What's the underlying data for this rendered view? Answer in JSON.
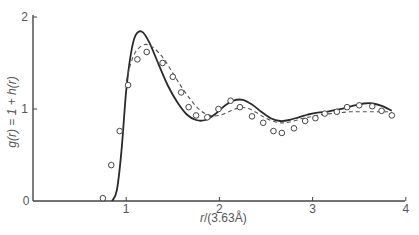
{
  "chart_data": {
    "type": "line",
    "title": "",
    "xlabel": "r/(3.63Å)",
    "ylabel": "g(r) = 1 + h(r)",
    "xlim": [
      0,
      4
    ],
    "ylim": [
      0,
      2
    ],
    "x_ticks": [
      "0",
      "1",
      "2",
      "3",
      "4"
    ],
    "y_ticks": [
      "0",
      "1",
      "2"
    ],
    "grid": false,
    "legend": null,
    "series": [
      {
        "name": "theory (solid)",
        "style": "solid",
        "x": [
          0.85,
          0.9,
          0.95,
          1.0,
          1.05,
          1.1,
          1.17,
          1.25,
          1.35,
          1.45,
          1.55,
          1.65,
          1.75,
          1.85,
          1.95,
          2.05,
          2.15,
          2.25,
          2.35,
          2.45,
          2.55,
          2.65,
          2.75,
          2.85,
          2.95,
          3.05,
          3.15,
          3.25,
          3.35,
          3.45,
          3.55,
          3.65,
          3.75,
          3.85
        ],
        "y": [
          0.0,
          0.12,
          0.55,
          1.2,
          1.6,
          1.8,
          1.84,
          1.72,
          1.48,
          1.25,
          1.07,
          0.94,
          0.88,
          0.88,
          0.94,
          1.03,
          1.09,
          1.1,
          1.05,
          0.97,
          0.9,
          0.87,
          0.88,
          0.91,
          0.94,
          0.96,
          0.97,
          0.99,
          1.01,
          1.04,
          1.06,
          1.06,
          1.03,
          0.98
        ]
      },
      {
        "name": "theory (dashed)",
        "style": "dashed",
        "x": [
          1.0,
          1.05,
          1.1,
          1.17,
          1.23,
          1.3,
          1.4,
          1.5,
          1.6,
          1.7,
          1.8,
          1.9,
          2.0,
          2.1,
          2.2,
          2.3,
          2.4,
          2.5,
          2.6,
          2.7,
          2.8,
          2.9,
          3.0,
          3.1,
          3.2,
          3.3,
          3.4,
          3.5,
          3.6,
          3.7,
          3.8,
          3.85
        ],
        "y": [
          1.3,
          1.5,
          1.62,
          1.69,
          1.7,
          1.66,
          1.55,
          1.39,
          1.23,
          1.09,
          0.98,
          0.93,
          0.93,
          0.97,
          1.01,
          1.01,
          0.96,
          0.9,
          0.86,
          0.85,
          0.87,
          0.9,
          0.92,
          0.94,
          0.95,
          0.96,
          0.97,
          0.97,
          0.97,
          0.97,
          0.97,
          0.96
        ]
      },
      {
        "name": "experiment (circles)",
        "style": "markers",
        "x": [
          0.75,
          0.84,
          0.93,
          1.02,
          1.12,
          1.22,
          1.39,
          1.5,
          1.59,
          1.67,
          1.75,
          1.87,
          1.99,
          2.12,
          2.22,
          2.35,
          2.47,
          2.58,
          2.67,
          2.8,
          2.92,
          3.03,
          3.13,
          3.26,
          3.37,
          3.5,
          3.64,
          3.74,
          3.85
        ],
        "y": [
          0.03,
          0.39,
          0.76,
          1.26,
          1.54,
          1.62,
          1.5,
          1.35,
          1.18,
          1.02,
          0.93,
          0.91,
          1.0,
          1.09,
          1.02,
          0.92,
          0.85,
          0.76,
          0.74,
          0.79,
          0.87,
          0.9,
          0.95,
          0.97,
          1.02,
          1.04,
          1.03,
          0.98,
          0.93
        ]
      }
    ]
  },
  "axes": {
    "x_label_main": "r",
    "x_label_unit": "/(3.63Å)",
    "y_label": "g(r) = 1 + h(r)"
  },
  "colors": {
    "line": "#2a2a2a",
    "axis": "#444444",
    "text": "#555555"
  }
}
